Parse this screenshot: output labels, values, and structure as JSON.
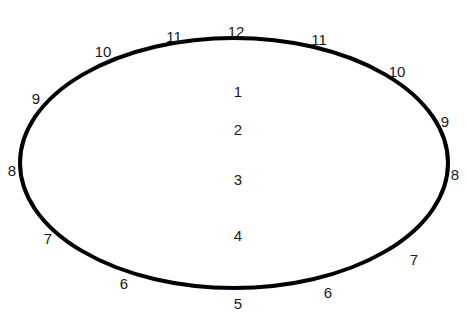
{
  "figure": {
    "width": 468,
    "height": 318,
    "background_color": "#ffffff",
    "stroke_color": "#000000",
    "label_color": "#1a1a1a",
    "ellipse": {
      "center_x": 234,
      "center_y": 163,
      "radius_x": 214,
      "radius_y": 125,
      "stroke_width": 4
    },
    "perimeter_labels": [
      {
        "text": "12",
        "x": 236,
        "y": 31,
        "position": "top-center"
      },
      {
        "text": "11",
        "x": 174,
        "y": 36,
        "position": "top-left-inner"
      },
      {
        "text": "10",
        "x": 103,
        "y": 51,
        "position": "top-left-outer"
      },
      {
        "text": "9",
        "x": 36,
        "y": 98,
        "position": "upper-left"
      },
      {
        "text": "8",
        "x": 12,
        "y": 170,
        "position": "left"
      },
      {
        "text": "7",
        "x": 48,
        "y": 238,
        "position": "lower-left"
      },
      {
        "text": "6",
        "x": 124,
        "y": 283,
        "position": "bottom-left-outer"
      },
      {
        "text": "5",
        "x": 238,
        "y": 303,
        "position": "bottom-center"
      },
      {
        "text": "6",
        "x": 328,
        "y": 292,
        "position": "bottom-right-outer"
      },
      {
        "text": "7",
        "x": 414,
        "y": 259,
        "position": "lower-right"
      },
      {
        "text": "8",
        "x": 455,
        "y": 174,
        "position": "right"
      },
      {
        "text": "9",
        "x": 445,
        "y": 121,
        "position": "upper-right"
      },
      {
        "text": "10",
        "x": 397,
        "y": 71,
        "position": "top-right-outer"
      },
      {
        "text": "11",
        "x": 319,
        "y": 39,
        "position": "top-right-inner"
      }
    ],
    "interior_labels": [
      {
        "text": "1",
        "x": 238,
        "y": 91
      },
      {
        "text": "2",
        "x": 238,
        "y": 129
      },
      {
        "text": "3",
        "x": 238,
        "y": 179
      },
      {
        "text": "4",
        "x": 238,
        "y": 235
      }
    ]
  }
}
